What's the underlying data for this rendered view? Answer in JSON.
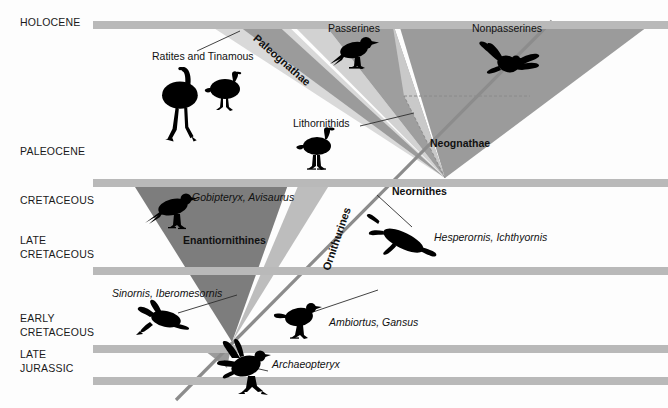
{
  "figure": {
    "type": "phylogenetic-timeline-diagram",
    "width": 668,
    "height": 408,
    "background_color": "#fdfdfd"
  },
  "colors": {
    "timeline_bar": "#b9b9b9",
    "wedge_dark": "#7d7d7d",
    "wedge_medium": "#9b9b9b",
    "wedge_light": "#c6c6c6",
    "wedge_pale": "#dcdcdc",
    "silhouette": "#000000",
    "leader_line": "#333333",
    "text": "#111111"
  },
  "time_axis": {
    "periods": [
      {
        "id": "holocene",
        "label": "HOLOCENE",
        "bar_y": 21,
        "label_y": 21
      },
      {
        "id": "paleocene",
        "label": "PALEOCENE",
        "bar_y": 179,
        "label_y": 150
      },
      {
        "id": "cretaceous",
        "label": "CRETACEOUS",
        "bar_y": 179,
        "label_y": 199
      },
      {
        "id": "late-cretaceous",
        "label": "LATE\nCRETACEOUS",
        "bar_y": 267,
        "label_y": 239
      },
      {
        "id": "early-cretaceous",
        "label": "EARLY\nCRETACEOUS",
        "bar_y": 345,
        "label_y": 317
      },
      {
        "id": "late-jurassic",
        "label": "LATE\nJURASSIC",
        "bar_y": 377,
        "label_y": 353
      }
    ],
    "bar_x_start": 93,
    "bar_x_end": 668,
    "bar_height": 8
  },
  "clades": {
    "paleognathae": {
      "label": "Paleognathae",
      "style": "rotated-bold"
    },
    "neognathae": {
      "label": "Neognathae",
      "style": "bold"
    },
    "neornithes": {
      "label": "Neornithes",
      "style": "bold"
    },
    "enantiornithines": {
      "label": "Enantiornithines",
      "style": "bold"
    },
    "ornithurines": {
      "label": "Ornithurines",
      "style": "rotated-bold"
    }
  },
  "taxa_labels": [
    {
      "id": "ratites-tinamous",
      "text": "Ratites and Tinamous",
      "italic": false,
      "x": 152,
      "y": 55
    },
    {
      "id": "passerines",
      "text": "Passerines",
      "italic": false,
      "x": 328,
      "y": 27
    },
    {
      "id": "nonpasserines",
      "text": "Nonpasserines",
      "italic": false,
      "x": 472,
      "y": 27
    },
    {
      "id": "lithornithids",
      "text": "Lithornithids",
      "italic": false,
      "x": 293,
      "y": 122
    },
    {
      "id": "gobipteryx-avisaurus",
      "text": "Gobipteryx, Avisaurus",
      "italic": true,
      "x": 192,
      "y": 196
    },
    {
      "id": "hesperornis",
      "text": "Hesperornis, Ichthyornis",
      "italic": true,
      "x": 434,
      "y": 236
    },
    {
      "id": "sinornis",
      "text": "Sinornis, Iberomesornis",
      "italic": true,
      "x": 112,
      "y": 292
    },
    {
      "id": "ambiortus-gansus",
      "text": "Ambiortus, Gansus",
      "italic": true,
      "x": 329,
      "y": 321
    },
    {
      "id": "archaeopteryx",
      "text": "Archaeopteryx",
      "italic": true,
      "x": 272,
      "y": 363
    }
  ],
  "clade_label_positions": [
    {
      "id": "neognathae",
      "text": "Neognathae",
      "x": 430,
      "y": 142
    },
    {
      "id": "neornithes",
      "text": "Neornithes",
      "x": 392,
      "y": 190
    },
    {
      "id": "enantiornithines",
      "text": "Enantiornithines",
      "x": 183,
      "y": 239
    }
  ],
  "rotated_labels": [
    {
      "id": "paleognathae",
      "text": "Paleognathae",
      "x": 259,
      "y": 32,
      "angle": 41
    },
    {
      "id": "ornithurines",
      "text": "Ornithurines",
      "x": 320,
      "y": 268,
      "angle": -71
    }
  ],
  "silhouettes": [
    {
      "id": "ostrich-silhouette",
      "taxon": "Ratites",
      "x": 161,
      "y": 73
    },
    {
      "id": "tinamou-silhouette",
      "taxon": "Tinamous",
      "x": 212,
      "y": 78
    },
    {
      "id": "passerine-silhouette",
      "taxon": "Passerines",
      "x": 340,
      "y": 42
    },
    {
      "id": "nonpasserine-silhouette",
      "taxon": "Nonpasserines",
      "x": 487,
      "y": 42
    },
    {
      "id": "lithornithid-silhouette",
      "taxon": "Lithornithids",
      "x": 305,
      "y": 138
    },
    {
      "id": "gobipteryx-silhouette",
      "taxon": "Gobipteryx",
      "x": 157,
      "y": 198
    },
    {
      "id": "hesperornis-silhouette",
      "taxon": "Hesperornis",
      "x": 392,
      "y": 228
    },
    {
      "id": "sinornis-silhouette",
      "taxon": "Sinornis",
      "x": 145,
      "y": 310
    },
    {
      "id": "ambiortus-silhouette",
      "taxon": "Ambiortus",
      "x": 288,
      "y": 308
    },
    {
      "id": "archaeopteryx-silhouette",
      "taxon": "Archaeopteryx",
      "x": 222,
      "y": 355
    }
  ]
}
